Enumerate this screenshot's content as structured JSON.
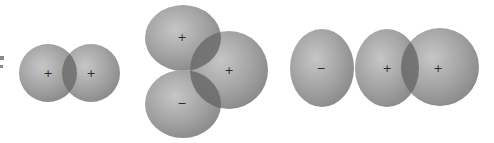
{
  "diagram": {
    "colors": {
      "background": "#ffffff",
      "sphere_highlight": "#c4c4c4",
      "sphere_mid": "#a2a2a2",
      "sphere_edge": "#858585",
      "overlap": "#6a6a6a",
      "sign": "#2a2a2a"
    },
    "groups": [
      {
        "name": "pair",
        "spheres": [
          {
            "cx": 48,
            "cy": 73,
            "rx": 29,
            "ry": 29,
            "sign": "+"
          },
          {
            "cx": 91,
            "cy": 73,
            "rx": 29,
            "ry": 29,
            "sign": "+"
          }
        ]
      },
      {
        "name": "triad",
        "spheres": [
          {
            "cx": 183,
            "cy": 38,
            "rx": 38,
            "ry": 33,
            "sign": "+"
          },
          {
            "cx": 183,
            "cy": 104,
            "rx": 38,
            "ry": 34,
            "sign": "−"
          },
          {
            "cx": 229,
            "cy": 70,
            "rx": 39,
            "ry": 39,
            "sign": "+"
          }
        ]
      },
      {
        "name": "row",
        "spheres": [
          {
            "cx": 322,
            "cy": 68,
            "rx": 32,
            "ry": 39,
            "sign": "−"
          },
          {
            "cx": 387,
            "cy": 68,
            "rx": 32,
            "ry": 39,
            "sign": "+"
          },
          {
            "cx": 440,
            "cy": 67,
            "rx": 39,
            "ry": 39,
            "sign": "+"
          }
        ]
      }
    ],
    "signs": {
      "s0": "+",
      "s1": "+",
      "s2": "+",
      "s3": "−",
      "s4": "+",
      "s5": "−",
      "s6": "+",
      "s7": "+"
    }
  }
}
